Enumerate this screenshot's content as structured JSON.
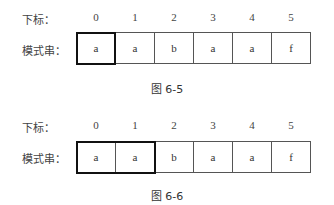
{
  "figures": [
    {
      "index_label": "下标：",
      "pattern_label": "模式串：",
      "indices": [
        "0",
        "1",
        "2",
        "3",
        "4",
        "5"
      ],
      "cells": [
        "a",
        "a",
        "b",
        "a",
        "a",
        "f"
      ],
      "highlight_count": 1,
      "caption": "图 6-5"
    },
    {
      "index_label": "下标：",
      "pattern_label": "模式串：",
      "indices": [
        "0",
        "1",
        "2",
        "3",
        "4",
        "5"
      ],
      "cells": [
        "a",
        "a",
        "b",
        "a",
        "a",
        "f"
      ],
      "highlight_count": 2,
      "caption": "图 6-6"
    }
  ]
}
